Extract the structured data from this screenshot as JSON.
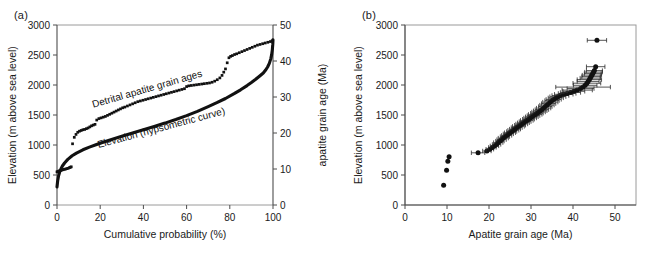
{
  "figure": {
    "panels": [
      {
        "id": "a",
        "label": "(a)",
        "xlabel": "Cumulative probability (%)",
        "ylabel_left": "Elevation (m above sea level)",
        "ylabel_right": "apatite grain age (Ma)",
        "annotation_detrital": "Detrital apatite grain ages",
        "annotation_hypsometric": "Elevation (hypsometric curve)"
      },
      {
        "id": "b",
        "label": "(b)",
        "xlabel": "Apatite grain age (Ma)",
        "ylabel": "Elevation (m above sea level)"
      }
    ]
  },
  "chart_data": [
    {
      "type": "line",
      "panel": "a",
      "title": "",
      "xlabel": "Cumulative probability (%)",
      "ylabel": "Elevation (m above sea level)",
      "y2label": "apatite grain age (Ma)",
      "xlim": [
        0,
        100
      ],
      "ylim": [
        0,
        3000
      ],
      "y2lim": [
        0,
        50
      ],
      "xticks": [
        0,
        20,
        40,
        60,
        80,
        100
      ],
      "yticks": [
        0,
        500,
        1000,
        1500,
        2000,
        2500,
        3000
      ],
      "y2ticks": [
        0,
        10,
        20,
        30,
        40,
        50
      ],
      "grid": false,
      "legend": "inline-annotations",
      "series": [
        {
          "name": "Elevation (hypsometric curve)",
          "axis": "left",
          "style": "thick-line",
          "x": [
            0,
            0.3,
            0.7,
            1.2,
            1.8,
            2.5,
            3.5,
            5,
            7,
            9,
            12,
            15,
            18,
            22,
            26,
            30,
            35,
            40,
            45,
            50,
            55,
            60,
            65,
            70,
            74,
            78,
            82,
            85,
            88,
            90,
            92,
            94,
            95.5,
            96.5,
            97.5,
            98.3,
            99,
            99.4,
            99.7,
            99.9,
            100
          ],
          "y": [
            300,
            400,
            480,
            545,
            600,
            650,
            700,
            760,
            820,
            865,
            920,
            965,
            1005,
            1055,
            1100,
            1145,
            1200,
            1255,
            1310,
            1365,
            1425,
            1490,
            1560,
            1640,
            1705,
            1775,
            1855,
            1920,
            1990,
            2040,
            2095,
            2155,
            2200,
            2245,
            2300,
            2360,
            2440,
            2510,
            2590,
            2680,
            2755
          ]
        },
        {
          "name": "Detrital apatite grain ages",
          "axis": "right",
          "style": "filled-squares",
          "x": [
            0,
            0.4,
            0.8,
            1.2,
            1.7,
            2.2,
            2.8,
            3.4,
            4.0,
            4.6,
            5.2,
            5.8,
            6.2,
            6.6,
            7.2,
            8.0,
            8.8,
            9.6,
            10.4,
            11.2,
            12.0,
            12.8,
            13.6,
            14.4,
            15.2,
            16.0,
            16.8,
            17.6,
            18.4,
            19.4,
            20.4,
            21.4,
            22.4,
            23.4,
            24.4,
            25.4,
            26.4,
            27.4,
            28.4,
            29.4,
            30.4,
            31.4,
            32.6,
            33.8,
            35.0,
            36.2,
            37.4,
            38.6,
            39.8,
            41.0,
            42.2,
            43.4,
            44.6,
            45.8,
            47.0,
            48.2,
            49.4,
            50.6,
            51.8,
            53.0,
            54.2,
            55.4,
            56.6,
            57.8,
            59.0,
            60.0,
            61.0,
            62.2,
            63.4,
            64.6,
            65.8,
            67.0,
            68.2,
            69.4,
            70.6,
            71.8,
            73.0,
            74.2,
            75.4,
            76.4,
            77.2,
            78.0,
            78.8,
            79.6,
            80.4,
            81.2,
            82.2,
            83.2,
            84.4,
            85.6,
            86.8,
            88.0,
            89.2,
            90.4,
            91.6,
            92.8,
            94.0,
            95.2,
            96.4,
            97.6,
            98.8,
            99.6
          ],
          "y_ma": [
            9.2,
            9.3,
            9.4,
            9.5,
            9.6,
            9.7,
            9.8,
            9.9,
            10.0,
            10.1,
            10.2,
            10.4,
            10.5,
            10.6,
            17.0,
            18.8,
            19.6,
            20.2,
            20.5,
            20.7,
            20.9,
            21.0,
            21.2,
            21.4,
            21.7,
            22.0,
            22.2,
            22.4,
            23.6,
            24.0,
            24.2,
            24.4,
            24.6,
            24.9,
            25.2,
            25.5,
            25.8,
            26.1,
            26.4,
            26.7,
            27.0,
            27.2,
            27.5,
            27.8,
            28.1,
            28.4,
            28.7,
            28.9,
            29.1,
            29.3,
            29.5,
            29.7,
            29.9,
            30.1,
            30.3,
            30.5,
            30.7,
            30.9,
            31.1,
            31.3,
            31.5,
            31.7,
            31.9,
            32.1,
            32.3,
            32.9,
            33.1,
            33.2,
            33.3,
            33.4,
            33.5,
            33.6,
            33.7,
            33.8,
            33.9,
            34.1,
            34.4,
            34.8,
            35.3,
            36.0,
            36.9,
            37.8,
            39.5,
            40.9,
            41.3,
            41.5,
            41.8,
            42.0,
            42.3,
            42.6,
            42.9,
            43.2,
            43.5,
            43.8,
            44.1,
            44.4,
            44.6,
            44.8,
            45.0,
            45.2,
            45.4,
            45.6
          ]
        }
      ]
    },
    {
      "type": "scatter",
      "panel": "b",
      "title": "",
      "xlabel": "Apatite grain age (Ma)",
      "ylabel": "Elevation (m above sea level)",
      "xlim": [
        0,
        55
      ],
      "ylim": [
        0,
        3000
      ],
      "xticks": [
        0,
        10,
        20,
        30,
        40,
        50
      ],
      "yticks": [
        0,
        500,
        1000,
        1500,
        2000,
        2500,
        3000
      ],
      "grid": false,
      "marker": "filled-circle",
      "errorbars": "horizontal (2-sigma age uncertainty)",
      "points": [
        {
          "x": 9.2,
          "y": 330,
          "xerr": 0
        },
        {
          "x": 9.9,
          "y": 580,
          "xerr": 0
        },
        {
          "x": 10.2,
          "y": 730,
          "xerr": 0
        },
        {
          "x": 10.5,
          "y": 805,
          "xerr": 0
        },
        {
          "x": 17.4,
          "y": 870,
          "xerr": 1.6
        },
        {
          "x": 19.5,
          "y": 900,
          "xerr": 1.0
        },
        {
          "x": 20.2,
          "y": 930,
          "xerr": 0.9
        },
        {
          "x": 20.8,
          "y": 960,
          "xerr": 0.9
        },
        {
          "x": 21.3,
          "y": 985,
          "xerr": 1.0
        },
        {
          "x": 21.8,
          "y": 1010,
          "xerr": 1.0
        },
        {
          "x": 22.2,
          "y": 1040,
          "xerr": 1.1
        },
        {
          "x": 22.6,
          "y": 1065,
          "xerr": 1.0
        },
        {
          "x": 23.0,
          "y": 1090,
          "xerr": 1.1
        },
        {
          "x": 23.4,
          "y": 1115,
          "xerr": 1.2
        },
        {
          "x": 23.8,
          "y": 1140,
          "xerr": 1.1
        },
        {
          "x": 24.2,
          "y": 1160,
          "xerr": 1.2
        },
        {
          "x": 24.6,
          "y": 1185,
          "xerr": 1.2
        },
        {
          "x": 25.0,
          "y": 1205,
          "xerr": 1.3
        },
        {
          "x": 25.4,
          "y": 1225,
          "xerr": 1.2
        },
        {
          "x": 25.8,
          "y": 1245,
          "xerr": 1.3
        },
        {
          "x": 26.2,
          "y": 1265,
          "xerr": 1.3
        },
        {
          "x": 26.6,
          "y": 1290,
          "xerr": 1.3
        },
        {
          "x": 27.0,
          "y": 1310,
          "xerr": 1.4
        },
        {
          "x": 27.4,
          "y": 1330,
          "xerr": 1.3
        },
        {
          "x": 27.8,
          "y": 1350,
          "xerr": 1.4
        },
        {
          "x": 28.2,
          "y": 1370,
          "xerr": 1.4
        },
        {
          "x": 28.6,
          "y": 1390,
          "xerr": 1.4
        },
        {
          "x": 29.0,
          "y": 1410,
          "xerr": 1.5
        },
        {
          "x": 29.4,
          "y": 1430,
          "xerr": 1.4
        },
        {
          "x": 29.8,
          "y": 1450,
          "xerr": 1.5
        },
        {
          "x": 30.2,
          "y": 1470,
          "xerr": 1.5
        },
        {
          "x": 30.6,
          "y": 1490,
          "xerr": 1.5
        },
        {
          "x": 31.0,
          "y": 1510,
          "xerr": 1.6
        },
        {
          "x": 31.4,
          "y": 1530,
          "xerr": 1.5
        },
        {
          "x": 31.8,
          "y": 1550,
          "xerr": 1.6
        },
        {
          "x": 32.2,
          "y": 1570,
          "xerr": 1.6
        },
        {
          "x": 32.6,
          "y": 1590,
          "xerr": 1.6
        },
        {
          "x": 33.0,
          "y": 1615,
          "xerr": 1.7
        },
        {
          "x": 33.4,
          "y": 1640,
          "xerr": 1.6
        },
        {
          "x": 33.8,
          "y": 1665,
          "xerr": 1.7
        },
        {
          "x": 34.2,
          "y": 1690,
          "xerr": 1.7
        },
        {
          "x": 34.6,
          "y": 1715,
          "xerr": 1.8
        },
        {
          "x": 35.0,
          "y": 1740,
          "xerr": 1.7
        },
        {
          "x": 35.4,
          "y": 1760,
          "xerr": 1.8
        },
        {
          "x": 35.9,
          "y": 1785,
          "xerr": 1.8
        },
        {
          "x": 36.4,
          "y": 1805,
          "xerr": 1.9
        },
        {
          "x": 37.0,
          "y": 1825,
          "xerr": 2.0
        },
        {
          "x": 37.8,
          "y": 1845,
          "xerr": 2.2
        },
        {
          "x": 38.6,
          "y": 1860,
          "xerr": 2.1
        },
        {
          "x": 39.4,
          "y": 1875,
          "xerr": 2.4
        },
        {
          "x": 40.2,
          "y": 1895,
          "xerr": 2.6
        },
        {
          "x": 41.0,
          "y": 1915,
          "xerr": 3.6
        },
        {
          "x": 41.8,
          "y": 1940,
          "xerr": 3.2
        },
        {
          "x": 42.4,
          "y": 1965,
          "xerr": 6.5
        },
        {
          "x": 42.9,
          "y": 1995,
          "xerr": 2.8
        },
        {
          "x": 43.3,
          "y": 2030,
          "xerr": 3.3
        },
        {
          "x": 43.6,
          "y": 2060,
          "xerr": 2.6
        },
        {
          "x": 43.9,
          "y": 2090,
          "xerr": 2.9
        },
        {
          "x": 44.1,
          "y": 2115,
          "xerr": 2.4
        },
        {
          "x": 44.3,
          "y": 2140,
          "xerr": 2.2
        },
        {
          "x": 44.5,
          "y": 2165,
          "xerr": 2.3
        },
        {
          "x": 44.7,
          "y": 2190,
          "xerr": 2.0
        },
        {
          "x": 44.9,
          "y": 2215,
          "xerr": 2.1
        },
        {
          "x": 45.1,
          "y": 2240,
          "xerr": 1.9
        },
        {
          "x": 45.4,
          "y": 2305,
          "xerr": 2.2
        },
        {
          "x": 45.7,
          "y": 2745,
          "xerr": 2.3
        }
      ]
    }
  ]
}
